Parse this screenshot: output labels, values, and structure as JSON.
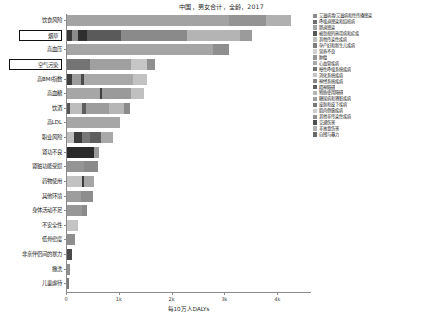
{
  "chart_data": {
    "type": "bar",
    "orientation": "horizontal",
    "stacked": true,
    "title": "中国，男女合计，全龄，2017",
    "xlabel": "每10万人DALYs",
    "ylabel": "",
    "xlim": [
      0,
      4600
    ],
    "xticks": [
      0,
      1000,
      2000,
      3000,
      4000
    ],
    "xtick_labels": [
      "0",
      "1k",
      "2k",
      "3k",
      "4k"
    ],
    "grid": false,
    "legend_position": "right",
    "categories": [
      "饮食风险",
      "烟草",
      "高血压",
      "空气污染",
      "高BMI指数",
      "高血糖",
      "饮酒",
      "高LDL",
      "职业风险",
      "肾功不良",
      "肾脏功能受损",
      "药物使用",
      "其他环境",
      "身体活动不足",
      "不安全性",
      "低骨密度",
      "非亲伴侣间的暴力",
      "撒洗",
      "儿童虐待"
    ],
    "highlighted_categories": [
      "烟草",
      "空气污染"
    ],
    "totals": [
      4240,
      3510,
      3060,
      1660,
      1510,
      1450,
      1190,
      1000,
      870,
      610,
      590,
      520,
      500,
      380,
      200,
      160,
      95,
      55,
      40
    ],
    "series": [
      {
        "name": "艾滋病毒/艾滋病和性传播感染",
        "color": "#8c8c8c"
      },
      {
        "name": "呼吸道感染和结核病",
        "color": "#6f6f6f"
      },
      {
        "name": "肠道感染",
        "color": "#a3a3a3"
      },
      {
        "name": "被忽视的热带病和疟疾",
        "color": "#595959"
      },
      {
        "name": "其他传染性疾病",
        "color": "#bcbcbc"
      },
      {
        "name": "孕产妇和新生儿疾病",
        "color": "#7d7d7d"
      },
      {
        "name": "营养不良",
        "color": "#d0d0d0"
      },
      {
        "name": "肿瘤",
        "color": "#949494"
      },
      {
        "name": "心血管疾病",
        "color": "#a9a9a9"
      },
      {
        "name": "慢性呼吸系统疾病",
        "color": "#717171"
      },
      {
        "name": "消化系统疾病",
        "color": "#c4c4c4"
      },
      {
        "name": "神经系统疾病",
        "color": "#868686"
      },
      {
        "name": "精神障碍",
        "color": "#616161"
      },
      {
        "name": "物质使用障碍",
        "color": "#b5b5b5"
      },
      {
        "name": "糖尿病和肾脏疾病",
        "color": "#9e9e9e"
      },
      {
        "name": "皮肤和皮下疾病",
        "color": "#787878"
      },
      {
        "name": "肌肉骨骼疾病",
        "color": "#cdcdcd"
      },
      {
        "name": "其他非传染性疾病",
        "color": "#8f8f8f"
      },
      {
        "name": "交通伤害",
        "color": "#4f4f4f"
      },
      {
        "name": "非故意伤害",
        "color": "#b0b0b0"
      },
      {
        "name": "自残与暴力",
        "color": "#6a6a6a"
      }
    ],
    "bars": [
      {
        "category": "饮食风险",
        "total": 4240,
        "segments": [
          {
            "series": "心血管疾病",
            "value": 3060,
            "color": "#a3a3a3"
          },
          {
            "series": "肿瘤",
            "value": 700,
            "color": "#949494"
          },
          {
            "series": "糖尿病和肾脏疾病",
            "value": 480,
            "color": "#b0b0b0"
          }
        ]
      },
      {
        "category": "烟草",
        "total": 3510,
        "segments": [
          {
            "series": "呼吸道感染和结核病",
            "value": 100,
            "color": "#3a3a3a"
          },
          {
            "series": "其他传染性疾病",
            "value": 110,
            "color": "#8c8c8c"
          },
          {
            "series": "肿瘤",
            "value": 170,
            "color": "#2e2e2e"
          },
          {
            "series": "慢性呼吸系统疾病",
            "value": 640,
            "color": "#5a5a5a"
          },
          {
            "series": "心血管疾病",
            "value": 1250,
            "color": "#8a8a8a"
          },
          {
            "series": "消化系统疾病",
            "value": 1000,
            "color": "#b4b4b4"
          },
          {
            "series": "糖尿病和肾脏疾病",
            "value": 240,
            "color": "#9b9b9b"
          }
        ]
      },
      {
        "category": "高血压",
        "total": 3060,
        "segments": [
          {
            "series": "心血管疾病",
            "value": 2760,
            "color": "#a5a5a5"
          },
          {
            "series": "糖尿病和肾脏疾病",
            "value": 300,
            "color": "#8f8f8f"
          }
        ]
      },
      {
        "category": "空气污染",
        "total": 1660,
        "segments": [
          {
            "series": "呼吸道感染和结核病",
            "value": 430,
            "color": "#747474"
          },
          {
            "series": "心血管疾病",
            "value": 790,
            "color": "#a0a0a0"
          },
          {
            "series": "慢性呼吸系统疾病",
            "value": 290,
            "color": "#c6c6c6"
          },
          {
            "series": "肿瘤",
            "value": 150,
            "color": "#909090"
          }
        ]
      },
      {
        "category": "高BMI指数",
        "total": 1510,
        "segments": [
          {
            "series": "糖尿病和肾脏疾病",
            "value": 90,
            "color": "#3d3d3d"
          },
          {
            "series": "心血管疾病",
            "value": 180,
            "color": "#9c9c9c"
          },
          {
            "series": "其他非传染性疾病",
            "value": 55,
            "color": "#4a4a4a"
          },
          {
            "series": "肌肉骨骼疾病",
            "value": 920,
            "color": "#a8a8a8"
          },
          {
            "series": "肿瘤",
            "value": 265,
            "color": "#c2c2c2"
          }
        ]
      },
      {
        "category": "高血糖",
        "total": 1450,
        "segments": [
          {
            "series": "糖尿病和肾脏疾病",
            "value": 620,
            "color": "#a6a6a6"
          },
          {
            "series": "心血管疾病",
            "value": 50,
            "color": "#3f3f3f"
          },
          {
            "series": "神经系统疾病",
            "value": 540,
            "color": "#9a9a9a"
          },
          {
            "series": "其他非传染性疾病",
            "value": 240,
            "color": "#c0c0c0"
          }
        ]
      },
      {
        "category": "饮酒",
        "total": 1190,
        "segments": [
          {
            "series": "交通伤害",
            "value": 60,
            "color": "#565656"
          },
          {
            "series": "消化系统疾病",
            "value": 230,
            "color": "#bdbdbd"
          },
          {
            "series": "物质使用障碍",
            "value": 75,
            "color": "#5e5e5e"
          },
          {
            "series": "心血管疾病",
            "value": 430,
            "color": "#9d9d9d"
          },
          {
            "series": "肿瘤",
            "value": 290,
            "color": "#b6b6b6"
          },
          {
            "series": "自残与暴力",
            "value": 105,
            "color": "#8b8b8b"
          }
        ]
      },
      {
        "category": "高LDL",
        "total": 1000,
        "segments": [
          {
            "series": "心血管疾病",
            "value": 1000,
            "color": "#a6a6a6"
          }
        ]
      },
      {
        "category": "职业风险",
        "total": 870,
        "segments": [
          {
            "series": "慢性呼吸系统疾病",
            "value": 140,
            "color": "#bdbdbd"
          },
          {
            "series": "肿瘤",
            "value": 135,
            "color": "#3c3c3c"
          },
          {
            "series": "呼吸道感染和结核病",
            "value": 160,
            "color": "#777777"
          },
          {
            "series": "肌肉骨骼疾病",
            "value": 200,
            "color": "#5f5f5f"
          },
          {
            "series": "非故意伤害",
            "value": 235,
            "color": "#a9a9a9"
          }
        ]
      },
      {
        "category": "肾功不良",
        "total": 610,
        "segments": [
          {
            "series": "糖尿病和肾脏疾病",
            "value": 520,
            "color": "#2a2a2a"
          },
          {
            "series": "心血管疾病",
            "value": 90,
            "color": "#9a9a9a"
          }
        ]
      },
      {
        "category": "肾脏功能受损",
        "total": 590,
        "segments": [
          {
            "series": "心血管疾病",
            "value": 330,
            "color": "#959595"
          },
          {
            "series": "糖尿病和肾脏疾病",
            "value": 260,
            "color": "#8a8a8a"
          }
        ]
      },
      {
        "category": "药物使用",
        "total": 520,
        "segments": [
          {
            "series": "物质使用障碍",
            "value": 280,
            "color": "#c2c2c2"
          },
          {
            "series": "自残与暴力",
            "value": 40,
            "color": "#3b3b3b"
          },
          {
            "series": "艾滋病毒/艾滋病和性传播感染",
            "value": 200,
            "color": "#a6a6a6"
          }
        ]
      },
      {
        "category": "其他环境",
        "total": 500,
        "segments": [
          {
            "series": "肠道感染",
            "value": 260,
            "color": "#9d9d9d"
          },
          {
            "series": "营养不良",
            "value": 240,
            "color": "#8d8d8d"
          }
        ]
      },
      {
        "category": "身体活动不足",
        "total": 380,
        "segments": [
          {
            "series": "心血管疾病",
            "value": 290,
            "color": "#979797"
          },
          {
            "series": "肿瘤",
            "value": 90,
            "color": "#8a8a8a"
          }
        ]
      },
      {
        "category": "不安全性",
        "total": 200,
        "segments": [
          {
            "series": "艾滋病毒/艾滋病和性传播感染",
            "value": 200,
            "color": "#c4c4c4"
          }
        ]
      },
      {
        "category": "低骨密度",
        "total": 160,
        "segments": [
          {
            "series": "非故意伤害",
            "value": 160,
            "color": "#8e8e8e"
          }
        ]
      },
      {
        "category": "非亲伴侣间的暴力",
        "total": 95,
        "segments": [
          {
            "series": "自残与暴力",
            "value": 95,
            "color": "#4a4a4a"
          }
        ]
      },
      {
        "category": "撒洗",
        "total": 55,
        "segments": [
          {
            "series": "其他传染性疾病",
            "value": 55,
            "color": "#8f8f8f"
          }
        ]
      },
      {
        "category": "儿童虐待",
        "total": 40,
        "segments": [
          {
            "series": "自残与暴力",
            "value": 40,
            "color": "#7a7a7a"
          }
        ]
      }
    ]
  }
}
